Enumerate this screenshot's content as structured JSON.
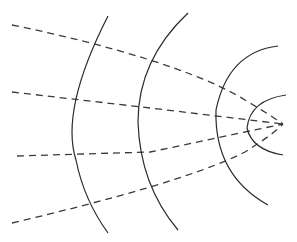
{
  "diagram": {
    "title": "",
    "elements": {
      "wavefront_count": 4,
      "ray_count": 4,
      "wavefront_style": "solid",
      "ray_style": "dashed"
    },
    "colors": {
      "background": "#ffffff",
      "wavefront": "#2a2a2a",
      "ray": "#3a3a3a"
    }
  }
}
